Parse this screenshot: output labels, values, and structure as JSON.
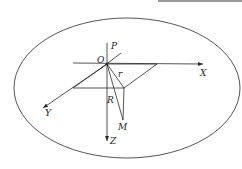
{
  "diagram": {
    "type": "3d-coordinate-system-in-ellipse",
    "colors": {
      "stroke": "#2a2a2a",
      "text": "#222222",
      "top_bar": "#9a9a9a",
      "background": "#ffffff"
    },
    "labels": {
      "origin": "O",
      "p_axis": "P",
      "x_axis": "X",
      "y_axis": "Y",
      "z_axis": "Z",
      "point_m": "M",
      "small_r": "r",
      "big_r": "R"
    },
    "nodes": [
      {
        "id": "O",
        "label": "O",
        "x": 107,
        "y": 64
      },
      {
        "id": "P",
        "label": "P",
        "x": 107,
        "y": 43
      },
      {
        "id": "X",
        "label": "X",
        "x": 203,
        "y": 64
      },
      {
        "id": "Y",
        "label": "Y",
        "x": 43,
        "y": 108
      },
      {
        "id": "Z",
        "label": "Z",
        "x": 107,
        "y": 141
      },
      {
        "id": "M",
        "label": "M",
        "x": 123,
        "y": 120
      }
    ],
    "edges": [
      {
        "from": "O",
        "to": "P",
        "label": ""
      },
      {
        "from": "O",
        "to": "X",
        "label": ""
      },
      {
        "from": "O",
        "to": "Y",
        "label": ""
      },
      {
        "from": "O",
        "to": "Z",
        "label": ""
      },
      {
        "from": "O",
        "to": "M",
        "label": "R"
      },
      {
        "from": "O",
        "to": "plane-corner",
        "label": "r"
      },
      {
        "from": "plane-corner",
        "to": "M",
        "label": ""
      }
    ]
  }
}
